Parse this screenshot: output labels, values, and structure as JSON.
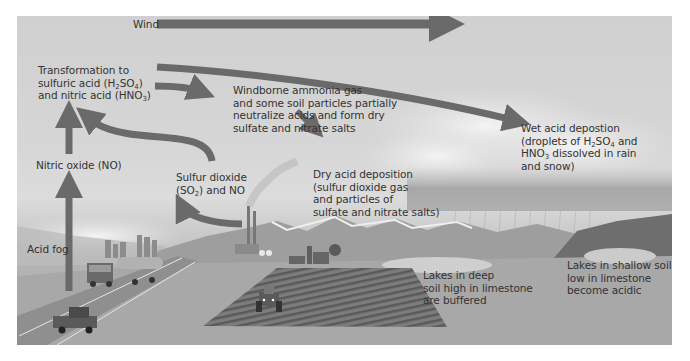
{
  "diagram": {
    "title": "",
    "colors": {
      "arrow": "#6a6a6a",
      "sky": "#d3d3d3",
      "ground": "#a5a5a5",
      "text": "#333333"
    },
    "labels": {
      "wind": "Wind",
      "transformation": {
        "line1": "Transformation to",
        "line2_prefix": "sulfuric acid (H",
        "line2_sub1": "2",
        "line2_mid": "SO",
        "line2_sub2": "4",
        "line2_suffix": ")",
        "line3_prefix": "and nitric acid (HNO",
        "line3_sub": "3",
        "line3_suffix": ")"
      },
      "windborne_ammonia": {
        "line1": "Windborne ammonia gas",
        "line2": "and some soil particles partially",
        "line3": "neutralize acids and form dry",
        "line4": "sulfate and nitrate salts"
      },
      "wet_deposition": {
        "line1": "Wet acid depostion",
        "line2_prefix": "(droplets of H",
        "line2_sub1": "2",
        "line2_mid": "SO",
        "line2_sub2": "4",
        "line2_suffix": " and",
        "line3_prefix": "HNO",
        "line3_sub": "3",
        "line3_suffix": " dissolved in rain",
        "line4": "and snow)"
      },
      "nitric_oxide": "Nitric oxide (NO)",
      "sulfur_dioxide": {
        "line1": "Sulfur dioxide",
        "line2_prefix": "(SO",
        "line2_sub": "2",
        "line2_suffix": ") and NO"
      },
      "dry_deposition": {
        "line1": "Dry acid deposition",
        "line2": "(sulfur dioxide gas",
        "line3": "and particles of",
        "line4": "sulfate and nitrate salts)"
      },
      "acid_fog": "Acid fog",
      "lakes_deep": {
        "line1": "Lakes in deep",
        "line2": "soil high in limestone",
        "line3": "are buffered"
      },
      "lakes_shallow": {
        "line1": "Lakes in shallow soil",
        "line2": "low in limestone",
        "line3": "become acidic"
      }
    },
    "scene_elements": [
      "wind-arrow",
      "transport-arrows",
      "clouds",
      "rain",
      "mountains",
      "smokestacks",
      "city-skyline",
      "highway",
      "tanker-truck",
      "pickup-truck",
      "farm-field",
      "tractor",
      "barn-silo",
      "lakes",
      "forested-hill"
    ]
  }
}
